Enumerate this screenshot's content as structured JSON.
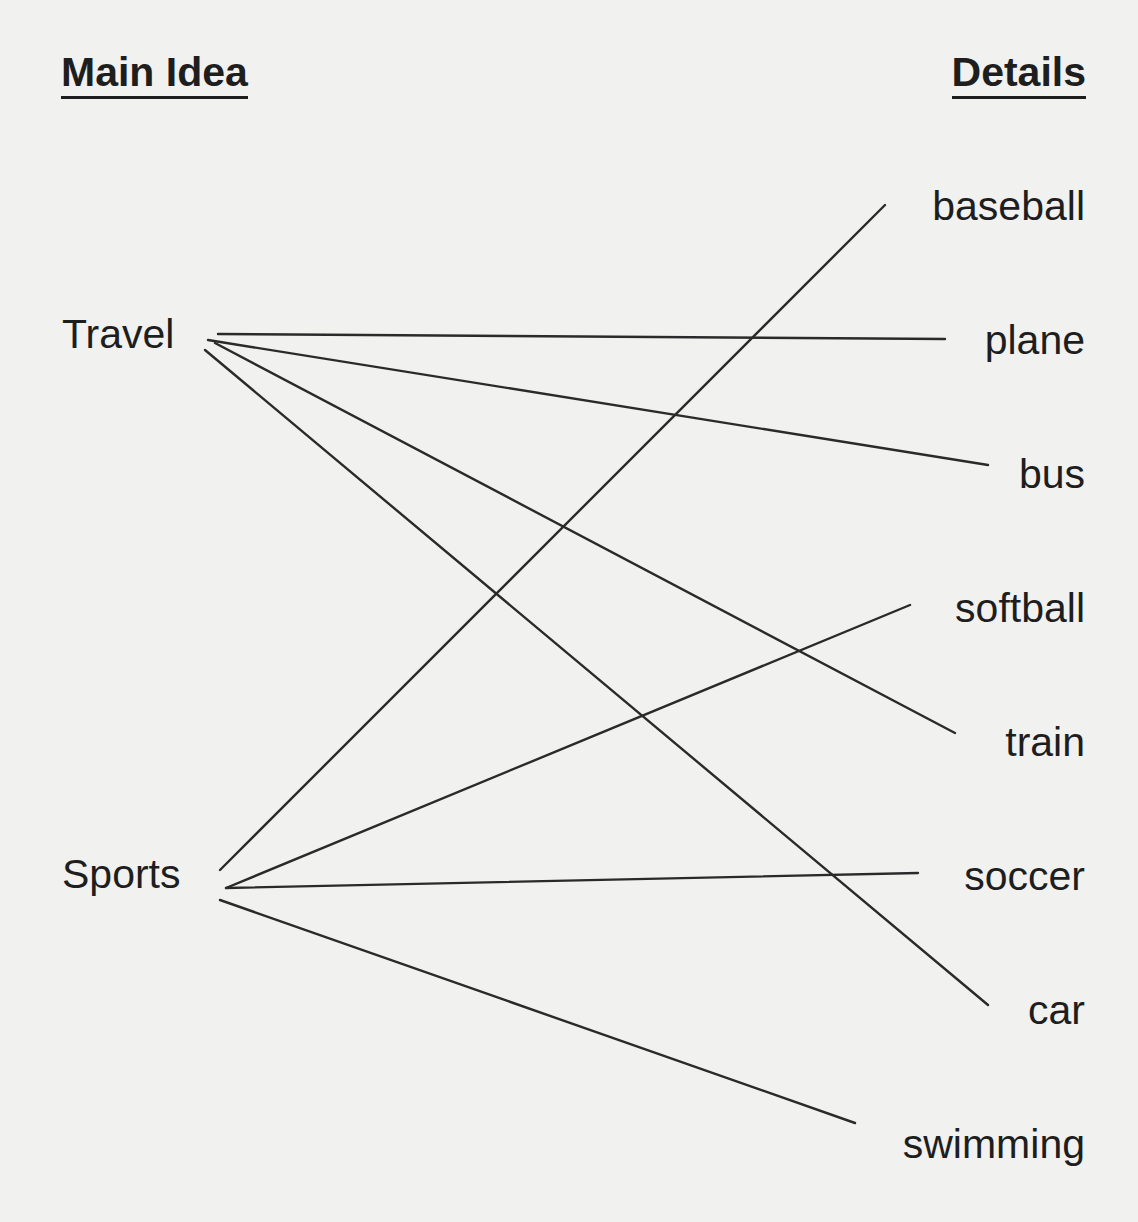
{
  "headings": {
    "main_idea": "Main Idea",
    "details": "Details"
  },
  "main_ideas": [
    {
      "label": "Travel",
      "top": 310
    },
    {
      "label": "Sports",
      "top": 850
    }
  ],
  "details": [
    {
      "label": "baseball",
      "top": 182
    },
    {
      "label": "plane",
      "top": 316
    },
    {
      "label": "bus",
      "top": 450
    },
    {
      "label": "softball",
      "top": 584
    },
    {
      "label": "train",
      "top": 718
    },
    {
      "label": "soccer",
      "top": 852
    },
    {
      "label": "car",
      "top": 986
    },
    {
      "label": "swimming",
      "top": 1120
    }
  ],
  "connections": [
    {
      "from": "Travel",
      "to": "plane",
      "x1": 218,
      "y1": 334,
      "x2": 945,
      "y2": 339
    },
    {
      "from": "Travel",
      "to": "bus",
      "x1": 208,
      "y1": 340,
      "x2": 988,
      "y2": 465
    },
    {
      "from": "Travel",
      "to": "train",
      "x1": 215,
      "y1": 343,
      "x2": 955,
      "y2": 733
    },
    {
      "from": "Travel",
      "to": "car",
      "x1": 205,
      "y1": 350,
      "x2": 988,
      "y2": 1005
    },
    {
      "from": "Sports",
      "to": "baseball",
      "x1": 220,
      "y1": 870,
      "x2": 885,
      "y2": 205
    },
    {
      "from": "Sports",
      "to": "softball",
      "x1": 226,
      "y1": 888,
      "x2": 910,
      "y2": 605
    },
    {
      "from": "Sports",
      "to": "soccer",
      "x1": 226,
      "y1": 888,
      "x2": 918,
      "y2": 873
    },
    {
      "from": "Sports",
      "to": "swimming",
      "x1": 220,
      "y1": 900,
      "x2": 855,
      "y2": 1123
    }
  ],
  "colors": {
    "background": "#f1f1f0",
    "ink": "#1e1e1e",
    "line": "#2a2a2a"
  }
}
